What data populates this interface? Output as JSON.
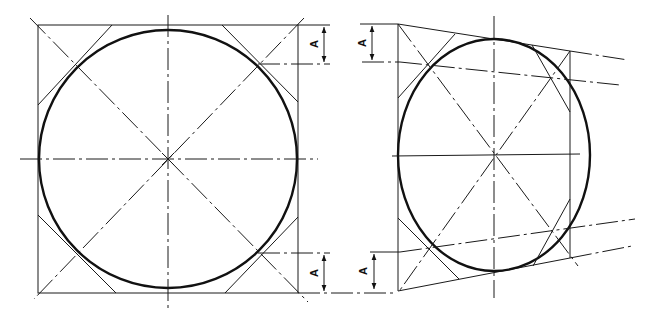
{
  "figure": {
    "left_view": {
      "description": "Circle inscribed in square with diagonals and 45-degree tangent chamfers",
      "dimension_labels": [
        "A",
        "A"
      ]
    },
    "right_view": {
      "description": "Ellipse inscribed in trapezoid (perspective of square) with diagonals and tangent chamfers",
      "dimension_labels": [
        "A",
        "A"
      ]
    }
  },
  "labels": {
    "left_top_dim": "A",
    "left_bottom_dim": "A",
    "right_top_dim": "A",
    "right_bottom_dim": "A"
  },
  "colors": {
    "ink": "#111111",
    "background": "#ffffff"
  }
}
